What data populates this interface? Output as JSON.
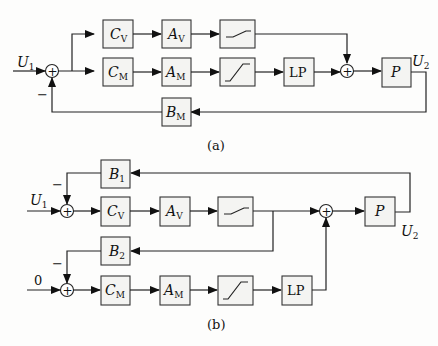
{
  "diagram_a": {
    "caption": "(a)",
    "input_label": "U",
    "input_sub": "1",
    "output_label": "U",
    "output_sub": "2",
    "feedback_sign": "−",
    "sum_symbol": "+",
    "blocks": {
      "cv": {
        "main": "C",
        "sub": "V"
      },
      "cm": {
        "main": "C",
        "sub": "M"
      },
      "av": {
        "main": "A",
        "sub": "V"
      },
      "am": {
        "main": "A",
        "sub": "M"
      },
      "lp": {
        "main": "LP"
      },
      "p": {
        "main": "P"
      },
      "bm": {
        "main": "B",
        "sub": "M"
      }
    }
  },
  "diagram_b": {
    "caption": "(b)",
    "input_label": "U",
    "input_sub": "1",
    "zero_input": "0",
    "output_label": "U",
    "output_sub": "2",
    "feedback_sign_1": "−",
    "feedback_sign_2": "−",
    "sum_symbol": "+",
    "blocks": {
      "b1": {
        "main": "B",
        "sub": "1"
      },
      "b2": {
        "main": "B",
        "sub": "2"
      },
      "cv": {
        "main": "C",
        "sub": "V"
      },
      "cm": {
        "main": "C",
        "sub": "M"
      },
      "av": {
        "main": "A",
        "sub": "V"
      },
      "am": {
        "main": "A",
        "sub": "M"
      },
      "lp": {
        "main": "LP"
      },
      "p": {
        "main": "P"
      }
    }
  }
}
